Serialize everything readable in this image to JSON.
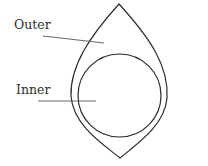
{
  "diagram": {
    "type": "labeled-shape-diagram",
    "colors": {
      "stroke": "#2b2b2b",
      "leader": "#555555",
      "text": "#2e2e2e",
      "background": "#ffffff"
    },
    "shapes": {
      "outer": {
        "name": "Outer",
        "kind": "pointed-oval",
        "top": [
          119,
          4
        ],
        "bottom": [
          120,
          158
        ],
        "left_x": 71,
        "right_x": 167
      },
      "inner": {
        "name": "Inner",
        "kind": "circle",
        "cx": 119.5,
        "cy": 95.5,
        "r": 41.5
      }
    },
    "labels": [
      {
        "id": "outer",
        "text": "Outer",
        "x": 14,
        "y": 29,
        "leader": [
          43,
          36,
          104,
          43
        ]
      },
      {
        "id": "inner",
        "text": "Inner",
        "x": 16,
        "y": 94,
        "leader": [
          38,
          101,
          96,
          101
        ]
      }
    ]
  }
}
